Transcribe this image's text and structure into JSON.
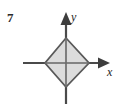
{
  "figure": {
    "problem_number": "7",
    "width": 122,
    "height": 104,
    "background_color": "#ffffff"
  },
  "axes": {
    "x_axis": {
      "label": "x",
      "color": "#4a4a4a",
      "start_x": 23,
      "end_x": 110,
      "y": 63,
      "arrow": "right"
    },
    "y_axis": {
      "label": "y",
      "color": "#4a4a4a",
      "x": 66,
      "start_y": 104,
      "end_y": 12,
      "arrow": "up"
    },
    "origin": {
      "x": 66,
      "y": 63
    }
  },
  "shape": {
    "name": "diamond",
    "description": "rotated square centered at origin",
    "fill_color": "#d9d9d9",
    "stroke_color": "#595959",
    "stroke_width": 1.6,
    "vertices": [
      {
        "x": 66,
        "y": 38
      },
      {
        "x": 89,
        "y": 63
      },
      {
        "x": 66,
        "y": 87
      },
      {
        "x": 45,
        "y": 63
      }
    ]
  }
}
